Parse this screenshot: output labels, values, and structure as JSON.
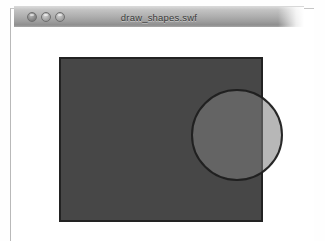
{
  "window": {
    "title": "draw_shapes.swf",
    "controls": [
      {
        "name": "close",
        "label": "close"
      },
      {
        "name": "minimize",
        "label": "minimize"
      },
      {
        "name": "zoom",
        "label": "zoom"
      }
    ]
  },
  "stage": {
    "background_color": "#ffffff",
    "shapes": [
      {
        "type": "rectangle",
        "name": "rectangle",
        "x": 46,
        "y": 31,
        "width": 202,
        "height": 163,
        "fill_color": "#474747",
        "stroke_color": "#222222",
        "stroke_width": 2,
        "alpha": 1
      },
      {
        "type": "circle",
        "name": "circle",
        "cx": 223,
        "cy": 108,
        "radius": 45,
        "fill_color": "#7c7c7c",
        "stroke_color": "#1e1e1e",
        "stroke_width": 2,
        "alpha": 0.55
      }
    ]
  }
}
